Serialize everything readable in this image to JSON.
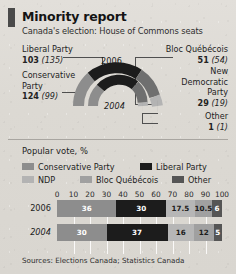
{
  "header": {
    "title": "Minority report",
    "subtitle": "Canada's election: House of Commons seats"
  },
  "seats": {
    "year_outer": "2006",
    "year_inner": "2004",
    "parties": [
      {
        "name": "Liberal Party",
        "seats_2006": "103",
        "seats_2004": "(135)",
        "color": "#1c1c1c"
      },
      {
        "name": "Conservative Party",
        "label_line1": "Conservative",
        "label_line2": "Party",
        "seats_2006": "124",
        "seats_2004": "(99)",
        "color": "#8d8d8d"
      },
      {
        "name": "Bloc Québécois",
        "seats_2006": "51",
        "seats_2004": "(54)",
        "color": "#6f6f6f"
      },
      {
        "name": "New Democratic Party",
        "label_line1": "New",
        "label_line2": "Democratic",
        "label_line3": "Party",
        "seats_2006": "29",
        "seats_2004": "(19)",
        "color": "#b3b3b3"
      },
      {
        "name": "Other",
        "seats_2006": "1",
        "seats_2004": "(1)",
        "color": "#555555"
      }
    ]
  },
  "popular_vote": {
    "title": "Popular vote, %",
    "legend": [
      {
        "label": "Conservative Party",
        "color": "#8d8d8d"
      },
      {
        "label": "Liberal Party",
        "color": "#1c1c1c"
      },
      {
        "label": "NDP",
        "color": "#b3b3b3"
      },
      {
        "label": "Bloc Québécois",
        "color": "#a0a0a0"
      },
      {
        "label": "Other",
        "color": "#555555"
      }
    ],
    "axis_ticks": [
      "0",
      "10",
      "20",
      "30",
      "40",
      "50",
      "60",
      "70",
      "80",
      "90",
      "100"
    ]
  },
  "source": "Sources: Elections Canada; Statistics Canada",
  "chart_data": [
    {
      "type": "pie",
      "title": "House of Commons seats",
      "subtitle": "Canada's election",
      "shape": "half-donut, two concentric rings",
      "rings": [
        {
          "name": "2006",
          "position": "outer",
          "total": 308,
          "slices": [
            {
              "label": "Conservative Party",
              "value": 124,
              "color": "#8d8d8d"
            },
            {
              "label": "Liberal Party",
              "value": 103,
              "color": "#1c1c1c"
            },
            {
              "label": "Bloc Québécois",
              "value": 51,
              "color": "#6f6f6f"
            },
            {
              "label": "New Democratic Party",
              "value": 29,
              "color": "#b3b3b3"
            },
            {
              "label": "Other",
              "value": 1,
              "color": "#555555"
            }
          ]
        },
        {
          "name": "2004",
          "position": "inner",
          "total": 308,
          "slices": [
            {
              "label": "Conservative Party",
              "value": 99,
              "color": "#8d8d8d"
            },
            {
              "label": "Liberal Party",
              "value": 135,
              "color": "#1c1c1c"
            },
            {
              "label": "Bloc Québécois",
              "value": 54,
              "color": "#6f6f6f"
            },
            {
              "label": "New Democratic Party",
              "value": 19,
              "color": "#b3b3b3"
            },
            {
              "label": "Other",
              "value": 1,
              "color": "#555555"
            }
          ]
        }
      ]
    },
    {
      "type": "bar",
      "orientation": "horizontal-stacked",
      "title": "Popular vote, %",
      "xlabel": "",
      "ylabel": "",
      "xlim": [
        0,
        100
      ],
      "grid": true,
      "legend_position": "top",
      "categories": [
        "2006",
        "2004"
      ],
      "series": [
        {
          "name": "Conservative Party",
          "color": "#8d8d8d",
          "values": [
            36,
            30
          ]
        },
        {
          "name": "Liberal Party",
          "color": "#1c1c1c",
          "values": [
            30,
            37
          ]
        },
        {
          "name": "NDP",
          "color": "#b3b3b3",
          "values": [
            17.5,
            16
          ]
        },
        {
          "name": "Bloc Québécois",
          "color": "#a0a0a0",
          "values": [
            10.5,
            12
          ]
        },
        {
          "name": "Other",
          "color": "#555555",
          "values": [
            6,
            5
          ]
        }
      ],
      "rows": [
        {
          "category": "2006",
          "italic": false,
          "segments": [
            {
              "label": "Conservative Party",
              "value": 36,
              "display": "36",
              "color": "#8d8d8d",
              "text": "#ffffff"
            },
            {
              "label": "Liberal Party",
              "value": 30,
              "display": "30",
              "color": "#1c1c1c",
              "text": "#ffffff"
            },
            {
              "label": "NDP",
              "value": 17.5,
              "display": "17.5",
              "color": "#b6b6b6",
              "text": "#1c1c1c"
            },
            {
              "label": "Bloc Québécois",
              "value": 10.5,
              "display": "10.5",
              "color": "#a0a0a0",
              "text": "#1c1c1c"
            },
            {
              "label": "Other",
              "value": 6,
              "display": "6",
              "color": "#555555",
              "text": "#ffffff"
            }
          ]
        },
        {
          "category": "2004",
          "italic": true,
          "segments": [
            {
              "label": "Conservative Party",
              "value": 30,
              "display": "30",
              "color": "#8d8d8d",
              "text": "#ffffff"
            },
            {
              "label": "Liberal Party",
              "value": 37,
              "display": "37",
              "color": "#1c1c1c",
              "text": "#ffffff"
            },
            {
              "label": "NDP",
              "value": 16,
              "display": "16",
              "color": "#b6b6b6",
              "text": "#1c1c1c"
            },
            {
              "label": "Bloc Québécois",
              "value": 12,
              "display": "12",
              "color": "#a0a0a0",
              "text": "#1c1c1c"
            },
            {
              "label": "Other",
              "value": 5,
              "display": "5",
              "color": "#555555",
              "text": "#ffffff"
            }
          ]
        }
      ]
    }
  ]
}
